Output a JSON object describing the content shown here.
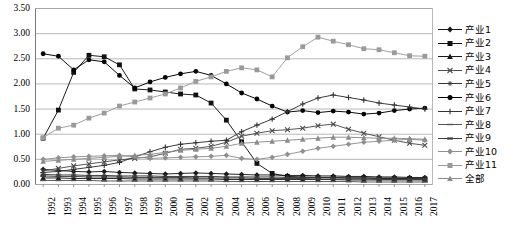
{
  "chart_data": {
    "type": "line",
    "title": "",
    "xlabel": "",
    "ylabel": "",
    "ylim": [
      0.0,
      3.5
    ],
    "ytick_step": 0.5,
    "grid": true,
    "legend_position": "right",
    "ytick_labels": [
      "0.00",
      "0.50",
      "1.00",
      "1.50",
      "2.00",
      "2.50",
      "3.00",
      "3.50"
    ],
    "categories": [
      1992,
      1993,
      1994,
      1995,
      1996,
      1997,
      1998,
      1999,
      2000,
      2001,
      2002,
      2003,
      2004,
      2005,
      2006,
      2007,
      2008,
      2009,
      2010,
      2011,
      2012,
      2013,
      2014,
      2015,
      2016,
      2017
    ],
    "x": [
      "1992",
      "1993",
      "1994",
      "1995",
      "1996",
      "1997",
      "1998",
      "1999",
      "2000",
      "2001",
      "2002",
      "2003",
      "2004",
      "2005",
      "2006",
      "2007",
      "2008",
      "2009",
      "2010",
      "2011",
      "2012",
      "2013",
      "2014",
      "2015",
      "2016",
      "2017"
    ],
    "series": [
      {
        "name": "产业1",
        "marker": "diamond",
        "color": "#1a1a1a",
        "values": [
          0.3,
          0.28,
          0.26,
          0.25,
          0.26,
          0.24,
          0.23,
          0.22,
          0.21,
          0.22,
          0.23,
          0.22,
          0.21,
          0.2,
          0.19,
          0.19,
          0.18,
          0.18,
          0.17,
          0.17,
          0.16,
          0.16,
          0.15,
          0.15,
          0.14,
          0.14
        ]
      },
      {
        "name": "产业2",
        "marker": "square",
        "color": "#111111",
        "values": [
          0.92,
          1.48,
          2.23,
          2.57,
          2.54,
          2.38,
          1.9,
          1.88,
          1.84,
          1.8,
          1.78,
          1.62,
          1.28,
          0.85,
          0.42,
          0.22,
          0.16,
          0.15,
          0.14,
          0.14,
          0.13,
          0.13,
          0.12,
          0.12,
          0.12,
          0.11
        ]
      },
      {
        "name": "产业3",
        "marker": "triangle",
        "color": "#1a1a1a",
        "values": [
          0.13,
          0.13,
          0.12,
          0.12,
          0.12,
          0.12,
          0.11,
          0.11,
          0.11,
          0.11,
          0.11,
          0.11,
          0.1,
          0.1,
          0.1,
          0.1,
          0.1,
          0.1,
          0.1,
          0.1,
          0.09,
          0.09,
          0.09,
          0.09,
          0.09,
          0.09
        ]
      },
      {
        "name": "产业4",
        "marker": "x",
        "color": "#4d4d4d",
        "values": [
          0.27,
          0.32,
          0.37,
          0.41,
          0.45,
          0.49,
          0.52,
          0.55,
          0.62,
          0.7,
          0.72,
          0.76,
          0.84,
          0.96,
          1.02,
          1.07,
          1.09,
          1.12,
          1.17,
          1.2,
          1.1,
          1.02,
          0.95,
          0.88,
          0.82,
          0.78
        ]
      },
      {
        "name": "产业5",
        "marker": "star",
        "color": "#333333",
        "values": [
          0.2,
          0.19,
          0.19,
          0.18,
          0.18,
          0.17,
          0.17,
          0.17,
          0.16,
          0.16,
          0.16,
          0.16,
          0.15,
          0.15,
          0.15,
          0.15,
          0.14,
          0.14,
          0.14,
          0.14,
          0.13,
          0.13,
          0.13,
          0.13,
          0.12,
          0.12
        ]
      },
      {
        "name": "产业6",
        "marker": "circle",
        "color": "#000000",
        "values": [
          2.6,
          2.55,
          2.28,
          2.48,
          2.44,
          2.17,
          1.92,
          2.04,
          2.13,
          2.2,
          2.25,
          2.17,
          2.0,
          1.82,
          1.7,
          1.56,
          1.44,
          1.47,
          1.43,
          1.46,
          1.44,
          1.4,
          1.42,
          1.47,
          1.5,
          1.52
        ]
      },
      {
        "name": "产业7",
        "marker": "plus",
        "color": "#333333",
        "values": [
          0.24,
          0.26,
          0.3,
          0.34,
          0.38,
          0.44,
          0.55,
          0.65,
          0.74,
          0.8,
          0.83,
          0.86,
          0.88,
          1.05,
          1.18,
          1.3,
          1.45,
          1.6,
          1.72,
          1.78,
          1.73,
          1.68,
          1.62,
          1.58,
          1.54,
          1.5
        ]
      },
      {
        "name": "产业8",
        "marker": "dash",
        "color": "#555555",
        "values": [
          0.08,
          0.08,
          0.08,
          0.08,
          0.07,
          0.07,
          0.07,
          0.07,
          0.07,
          0.07,
          0.07,
          0.07,
          0.06,
          0.06,
          0.06,
          0.06,
          0.06,
          0.06,
          0.06,
          0.06,
          0.06,
          0.05,
          0.05,
          0.05,
          0.05,
          0.05
        ]
      },
      {
        "name": "产业9",
        "marker": "bar",
        "color": "#3d3d3d",
        "values": [
          0.17,
          0.16,
          0.16,
          0.15,
          0.15,
          0.15,
          0.14,
          0.14,
          0.14,
          0.14,
          0.13,
          0.13,
          0.13,
          0.13,
          0.12,
          0.12,
          0.12,
          0.12,
          0.11,
          0.11,
          0.11,
          0.11,
          0.1,
          0.1,
          0.1,
          0.1
        ]
      },
      {
        "name": "产业10",
        "marker": "diamond",
        "color": "#909090",
        "values": [
          0.5,
          0.53,
          0.55,
          0.56,
          0.57,
          0.58,
          0.55,
          0.52,
          0.53,
          0.54,
          0.55,
          0.56,
          0.58,
          0.52,
          0.5,
          0.54,
          0.6,
          0.66,
          0.72,
          0.76,
          0.8,
          0.84,
          0.86,
          0.88,
          0.9,
          0.88
        ]
      },
      {
        "name": "产业11",
        "marker": "square",
        "color": "#9a9a9a",
        "values": [
          0.93,
          1.12,
          1.18,
          1.32,
          1.42,
          1.56,
          1.64,
          1.72,
          1.8,
          1.92,
          2.05,
          2.14,
          2.25,
          2.32,
          2.28,
          2.14,
          2.52,
          2.74,
          2.93,
          2.85,
          2.78,
          2.7,
          2.68,
          2.62,
          2.56,
          2.55
        ]
      },
      {
        "name": "全部",
        "marker": "triangle",
        "color": "#8c8c8c",
        "values": [
          0.46,
          0.48,
          0.5,
          0.52,
          0.54,
          0.56,
          0.58,
          0.6,
          0.64,
          0.68,
          0.7,
          0.72,
          0.76,
          0.82,
          0.84,
          0.86,
          0.88,
          0.9,
          0.92,
          0.94,
          0.94,
          0.93,
          0.92,
          0.92,
          0.91,
          0.9
        ]
      }
    ]
  },
  "legend": {
    "items": [
      {
        "label": "产业1"
      },
      {
        "label": "产业2"
      },
      {
        "label": "产业3"
      },
      {
        "label": "产业4"
      },
      {
        "label": "产业5"
      },
      {
        "label": "产业6"
      },
      {
        "label": "产业7"
      },
      {
        "label": "产业8"
      },
      {
        "label": "产业9"
      },
      {
        "label": "产业10"
      },
      {
        "label": "产业11"
      },
      {
        "label": "全部"
      }
    ]
  }
}
